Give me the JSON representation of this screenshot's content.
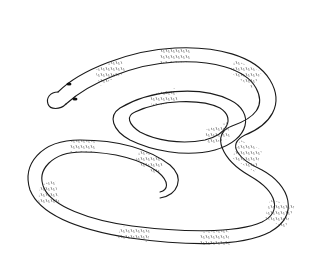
{
  "image": {
    "subject": "banded snake line drawing",
    "background": "#ffffff",
    "stroke_color": "#1a1a1a",
    "width": 313,
    "height": 268
  }
}
